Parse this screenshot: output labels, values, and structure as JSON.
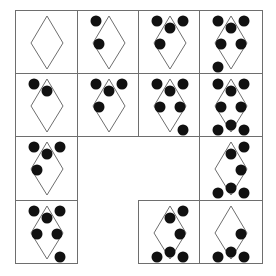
{
  "puzzle": {
    "grid": {
      "rows": 4,
      "cols": 4
    },
    "col_edges": [
      15,
      77,
      138,
      199,
      262
    ],
    "row_edges": [
      10,
      73,
      136,
      200,
      263
    ],
    "colors": {
      "line": "#6e6e6e",
      "dot": "#111111",
      "diamond": "#6e6e6e",
      "background": "#ffffff"
    },
    "dot_positions": {
      "TL": [
        18,
        10
      ],
      "TC": [
        31,
        17
      ],
      "TR": [
        44,
        10
      ],
      "ML": [
        21,
        33
      ],
      "MR": [
        41,
        33
      ],
      "BL": [
        18,
        56
      ],
      "BC": [
        31,
        51
      ],
      "BR": [
        44,
        56
      ]
    },
    "cells": [
      {
        "row": 0,
        "col": 0,
        "dots": []
      },
      {
        "row": 0,
        "col": 1,
        "dots": [
          "TL",
          "ML"
        ]
      },
      {
        "row": 0,
        "col": 2,
        "dots": [
          "TL",
          "TC",
          "TR",
          "ML"
        ]
      },
      {
        "row": 0,
        "col": 3,
        "dots": [
          "TL",
          "TC",
          "TR",
          "ML",
          "MR",
          "BL"
        ]
      },
      {
        "row": 1,
        "col": 0,
        "dots": [
          "TL",
          "TC"
        ]
      },
      {
        "row": 1,
        "col": 1,
        "dots": [
          "TL",
          "TC",
          "TR",
          "ML"
        ]
      },
      {
        "row": 1,
        "col": 2,
        "dots": [
          "TL",
          "TC",
          "TR",
          "ML",
          "MR",
          "BR"
        ]
      },
      {
        "row": 1,
        "col": 3,
        "dots": [
          "TL",
          "TC",
          "TR",
          "ML",
          "MR",
          "BL",
          "BC",
          "BR"
        ]
      },
      {
        "row": 2,
        "col": 0,
        "dots": [
          "TL",
          "TC",
          "TR",
          "ML"
        ]
      },
      {
        "row": 2,
        "col": 3,
        "dots": [
          "TC",
          "TR",
          "MR",
          "BL",
          "BC",
          "BR"
        ]
      },
      {
        "row": 3,
        "col": 0,
        "dots": [
          "TL",
          "TC",
          "TR",
          "ML",
          "MR",
          "BR"
        ]
      },
      {
        "row": 3,
        "col": 2,
        "dots": [
          "TC",
          "TR",
          "MR",
          "BL",
          "BC",
          "BR"
        ]
      },
      {
        "row": 3,
        "col": 3,
        "dots": [
          "MR",
          "BL",
          "BC",
          "BR"
        ]
      }
    ],
    "empty_cells": [
      {
        "row": 2,
        "col": 1
      },
      {
        "row": 2,
        "col": 2
      },
      {
        "row": 3,
        "col": 1
      }
    ]
  }
}
